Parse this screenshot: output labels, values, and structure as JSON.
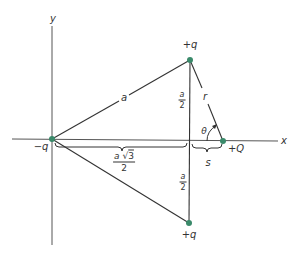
{
  "diagram": {
    "type": "charge-configuration",
    "colors": {
      "line": "#333333",
      "axis": "#555555",
      "charge": "#3a8a6a",
      "background": "#ffffff"
    },
    "axes": {
      "x_label": "x",
      "y_label": "y"
    },
    "charges": [
      {
        "id": "left",
        "label": "−q",
        "x": 52,
        "y": 139
      },
      {
        "id": "top",
        "label": "+q",
        "x": 190,
        "y": 60
      },
      {
        "id": "bottom",
        "label": "+q",
        "x": 189,
        "y": 223
      },
      {
        "id": "test",
        "label": "+Q",
        "x": 223,
        "y": 141
      }
    ],
    "segment_labels": {
      "side_a": "a",
      "r": "r",
      "theta": "θ",
      "s": "s",
      "half_a_top": {
        "num": "a",
        "den": "2"
      },
      "half_a_bottom": {
        "num": "a",
        "den": "2"
      },
      "height": {
        "num_a": "a",
        "num_sqrt": "3",
        "den": "2"
      }
    }
  }
}
